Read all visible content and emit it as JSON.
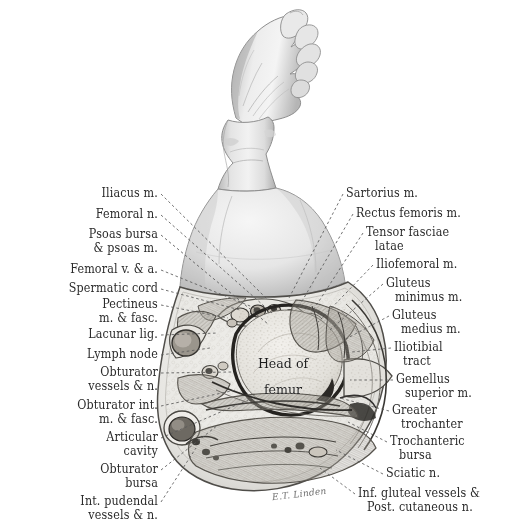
{
  "plate": {
    "title": "Transverse section through the hip joint",
    "background_color": "#ffffff",
    "ink_color": "#2b2b2b",
    "leader_color": "#5a5a5a"
  },
  "center_label": {
    "line1": "Head of",
    "line2": "femur"
  },
  "signature": "E.T. Linden",
  "labels_left": [
    {
      "id": "iliacus",
      "lines": [
        "Iliacus m."
      ],
      "x": 158,
      "y": 186,
      "tx": 268,
      "ty": 300
    },
    {
      "id": "femoral-nerve",
      "lines": [
        "Femoral n."
      ],
      "x": 158,
      "y": 207,
      "tx": 272,
      "ty": 313
    },
    {
      "id": "psoas-bursa",
      "lines": [
        "Psoas bursa",
        "& psoas m."
      ],
      "x": 158,
      "y": 227,
      "tx": 268,
      "ty": 324
    },
    {
      "id": "femoral-v-a",
      "lines": [
        "Femoral v. & a."
      ],
      "x": 158,
      "y": 262,
      "tx": 255,
      "ty": 308
    },
    {
      "id": "spermatic-cord",
      "lines": [
        "Spermatic cord"
      ],
      "x": 158,
      "y": 281,
      "tx": 240,
      "ty": 310
    },
    {
      "id": "pectineus",
      "lines": [
        "Pectineus",
        "m. & fasc."
      ],
      "x": 158,
      "y": 297,
      "tx": 228,
      "ty": 318
    },
    {
      "id": "lacunar-lig",
      "lines": [
        "Lacunar lig."
      ],
      "x": 158,
      "y": 327,
      "tx": 218,
      "ty": 333
    },
    {
      "id": "lymph-node",
      "lines": [
        "Lymph node"
      ],
      "x": 158,
      "y": 347,
      "tx": 210,
      "ty": 348
    },
    {
      "id": "obturator-vessels",
      "lines": [
        "Obturator",
        "vessels & n."
      ],
      "x": 158,
      "y": 365,
      "tx": 232,
      "ty": 372
    },
    {
      "id": "obturator-int",
      "lines": [
        "Obturator int.",
        "m. & fasc."
      ],
      "x": 158,
      "y": 398,
      "tx": 236,
      "ty": 390
    },
    {
      "id": "articular-cavity",
      "lines": [
        "Articular",
        "cavity"
      ],
      "x": 158,
      "y": 430,
      "tx": 248,
      "ty": 400
    },
    {
      "id": "obturator-bursa",
      "lines": [
        "Obturator",
        "bursa"
      ],
      "x": 158,
      "y": 462,
      "tx": 218,
      "ty": 425
    },
    {
      "id": "int-pudendal",
      "lines": [
        "Int. pudendal",
        "vessels & n."
      ],
      "x": 158,
      "y": 494,
      "tx": 196,
      "ty": 448
    }
  ],
  "labels_right": [
    {
      "id": "sartorius",
      "lines": [
        "Sartorius m."
      ],
      "x": 346,
      "y": 186,
      "tx": 288,
      "ty": 300
    },
    {
      "id": "rectus-femoris",
      "lines": [
        "Rectus femoris m."
      ],
      "x": 356,
      "y": 206,
      "tx": 298,
      "ty": 308
    },
    {
      "id": "tensor-fasciae",
      "lines": [
        "Tensor fasciae",
        "latae"
      ],
      "x": 366,
      "y": 225,
      "tx": 312,
      "ty": 312
    },
    {
      "id": "iliofemoral",
      "lines": [
        "Iliofemoral m."
      ],
      "x": 376,
      "y": 257,
      "tx": 318,
      "ty": 322
    },
    {
      "id": "gluteus-minimus",
      "lines": [
        "Gluteus",
        "minimus m."
      ],
      "x": 386,
      "y": 276,
      "tx": 330,
      "ty": 330
    },
    {
      "id": "gluteus-medius",
      "lines": [
        "Gluteus",
        "medius m."
      ],
      "x": 392,
      "y": 308,
      "tx": 344,
      "ty": 340
    },
    {
      "id": "iliotibial-tract",
      "lines": [
        "Iliotibial",
        "tract"
      ],
      "x": 394,
      "y": 340,
      "tx": 352,
      "ty": 352
    },
    {
      "id": "gemellus-superior",
      "lines": [
        "Gemellus",
        "superior m."
      ],
      "x": 396,
      "y": 372,
      "tx": 350,
      "ty": 380
    },
    {
      "id": "greater-troch",
      "lines": [
        "Greater",
        "trochanter"
      ],
      "x": 392,
      "y": 403,
      "tx": 340,
      "ty": 398
    },
    {
      "id": "trochanteric-bursa",
      "lines": [
        "Trochanteric",
        "bursa"
      ],
      "x": 390,
      "y": 434,
      "tx": 348,
      "ty": 422
    },
    {
      "id": "sciatic-nerve",
      "lines": [
        "Sciatic n."
      ],
      "x": 386,
      "y": 466,
      "tx": 336,
      "ty": 450
    },
    {
      "id": "inf-gluteal",
      "lines": [
        "Inf. gluteal vessels &",
        "Post. cutaneous n."
      ],
      "x": 358,
      "y": 486,
      "tx": 320,
      "ty": 468
    }
  ]
}
